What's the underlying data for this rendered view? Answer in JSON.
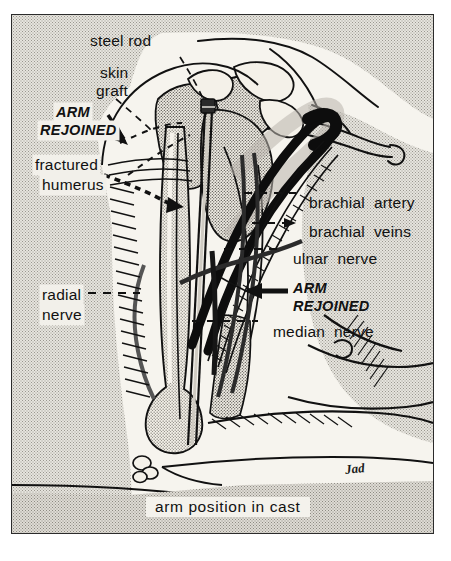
{
  "figure": {
    "kind": "medical-illustration",
    "caption": "arm position in cast",
    "signature": "Jad",
    "colors": {
      "ink": "#111111",
      "paper": "#f4f2ec",
      "stipple_gray": "#e6e4de",
      "frame": "#2b2b2b"
    }
  },
  "labels": {
    "steel_rod": "steel rod",
    "skin_graft_line1": "skin",
    "skin_graft_line2": "graft",
    "arm_rejoined_top_line1": "ARM",
    "arm_rejoined_top_line2": "REJOINED",
    "fractured_humerus_line1": "fractured",
    "fractured_humerus_line2": "humerus",
    "radial_nerve_line1": "radial",
    "radial_nerve_line2": "nerve",
    "brachial_artery": "brachial  artery",
    "brachial_veins": "brachial  veins",
    "ulnar_nerve": "ulnar  nerve",
    "arm_rejoined_mid_line1": "ARM",
    "arm_rejoined_mid_line2": "REJOINED",
    "median_nerve": "median  nerve"
  }
}
